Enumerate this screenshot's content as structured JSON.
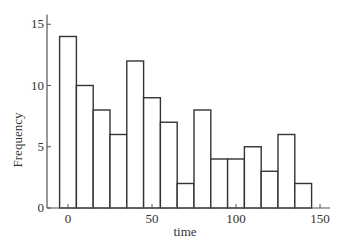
{
  "chart_data": {
    "type": "bar",
    "title": "",
    "xlabel": "time",
    "ylabel": "Frequency",
    "bin_width": 10,
    "bin_start": -5,
    "bins": [
      "-5–5",
      "5–15",
      "15–25",
      "25–35",
      "35–45",
      "45–55",
      "55–65",
      "65–75",
      "75–85",
      "85–95",
      "95–105",
      "105–115",
      "115–125",
      "125–135",
      "135–145"
    ],
    "values": [
      14,
      10,
      8,
      6,
      12,
      9,
      7,
      2,
      8,
      4,
      4,
      5,
      3,
      6,
      2
    ],
    "xticks": [
      0,
      50,
      100,
      150
    ],
    "yticks": [
      0,
      5,
      10,
      15
    ],
    "xlim": [
      -11,
      156
    ],
    "ylim": [
      0,
      15.8
    ],
    "grid": false,
    "legend": null
  },
  "axis": {
    "xlabel": "time",
    "ylabel": "Frequency",
    "xtick_labels": [
      "0",
      "50",
      "100",
      "150"
    ],
    "ytick_labels": [
      "0",
      "5",
      "10",
      "15"
    ]
  }
}
